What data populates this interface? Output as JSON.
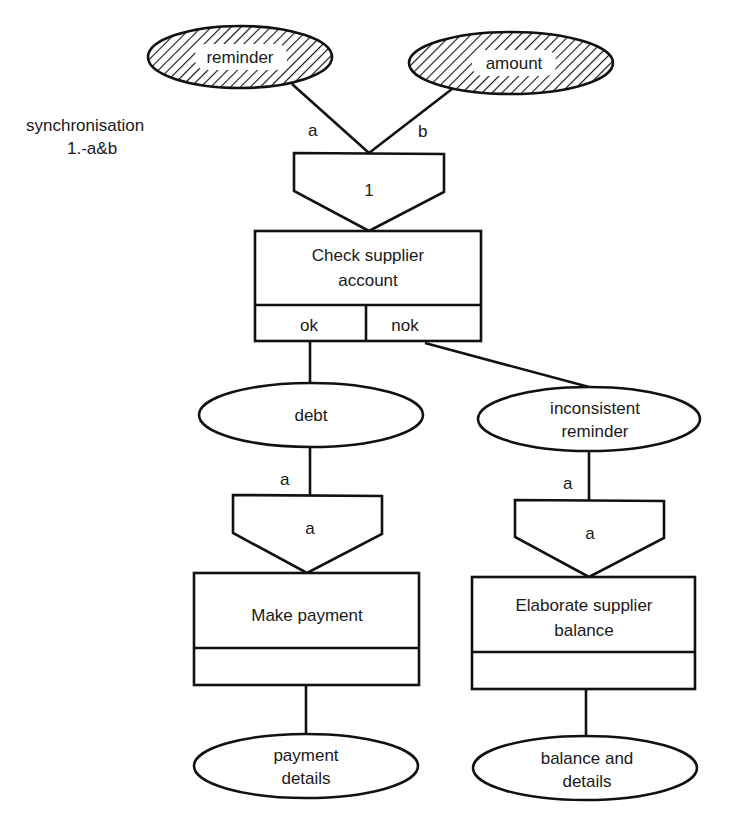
{
  "annotation": {
    "line1": "synchronisation",
    "line2": "1.-a&b"
  },
  "inputs": {
    "reminder": "reminder",
    "amount": "amount",
    "edge_a": "a",
    "edge_b": "b"
  },
  "sync_top": {
    "label": "1"
  },
  "process_check": {
    "line1": "Check supplier",
    "line2": "account",
    "outcomes": [
      "ok",
      "nok"
    ]
  },
  "events_mid": {
    "debt": "debt",
    "inconsistent_line1": "inconsistent",
    "inconsistent_line2": "reminder"
  },
  "left_branch": {
    "edge_label": "a",
    "sync_label": "a",
    "process": "Make payment",
    "result_line1": "payment",
    "result_line2": "details"
  },
  "right_branch": {
    "edge_label": "a",
    "sync_label": "a",
    "process_line1": "Elaborate supplier",
    "process_line2": "balance",
    "result_line1": "balance and",
    "result_line2": "details"
  },
  "colors": {
    "ink": "#111111",
    "background": "#ffffff"
  }
}
